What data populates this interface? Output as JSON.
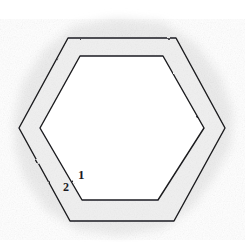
{
  "figure": {
    "canvas": {
      "width": 245,
      "height": 242,
      "background": "#ffffff"
    },
    "style": {
      "stroke_color": "#1b1b1f",
      "band_fill": "#f0f0f0",
      "inner_fill": "#ffffff",
      "halo_color": "#e8e8e8",
      "stroke_width": 1.4
    },
    "shapes": [
      {
        "name": "outer-hexagon",
        "kind": "hexagon",
        "orientation": "flat-top",
        "points": [
          [
            19,
            128
          ],
          [
            68,
            38
          ],
          [
            176,
            38
          ],
          [
            225,
            128
          ],
          [
            174,
            221
          ],
          [
            70,
            221
          ]
        ]
      },
      {
        "name": "inner-hexagon",
        "kind": "hexagon",
        "orientation": "flat-top",
        "points": [
          [
            40,
            128
          ],
          [
            80,
            56
          ],
          [
            163,
            56
          ],
          [
            204,
            128
          ],
          [
            158,
            200
          ],
          [
            82,
            200
          ]
        ]
      }
    ],
    "halo": {
      "name": "pencil-halo",
      "points": [
        [
          14,
          120
        ],
        [
          22,
          84
        ],
        [
          44,
          50
        ],
        [
          74,
          26
        ],
        [
          116,
          18
        ],
        [
          162,
          22
        ],
        [
          196,
          44
        ],
        [
          220,
          76
        ],
        [
          233,
          112
        ],
        [
          231,
          146
        ],
        [
          214,
          178
        ],
        [
          192,
          208
        ],
        [
          162,
          229
        ],
        [
          120,
          236
        ],
        [
          78,
          230
        ],
        [
          46,
          210
        ],
        [
          24,
          178
        ],
        [
          15,
          148
        ]
      ]
    },
    "labels": [
      {
        "id": "label-1",
        "text": "1",
        "x": 81,
        "y": 174,
        "refers_to": "inner-hexagon"
      },
      {
        "id": "label-2",
        "text": "2",
        "x": 66,
        "y": 187,
        "refers_to": "band-between-hexagons"
      }
    ]
  }
}
